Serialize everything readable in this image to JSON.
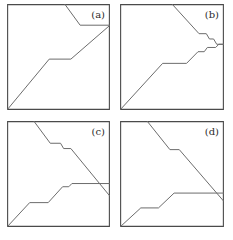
{
  "figure": {
    "width": 233,
    "height": 240,
    "background": "#ffffff",
    "frame_color": "#4a4a4a",
    "line_color": "#6b6b6b",
    "label_color": "#2a2a2a",
    "panel_count": 4,
    "layout": "2x2 grid"
  },
  "chart_data": {
    "type": "line",
    "title": "",
    "xlabel": "",
    "ylabel": "",
    "grid": false,
    "legend": "none",
    "axis_ranges": {
      "x": [
        0,
        100
      ],
      "y": [
        0,
        100
      ]
    },
    "panels": [
      {
        "id": "a",
        "label": "(a)",
        "frame": {
          "x": 7,
          "y": 4,
          "width": 103,
          "height": 106
        },
        "series": [
          {
            "name": "upper-path",
            "points": [
              [
                56,
                0
              ],
              [
                71,
                20
              ],
              [
                100,
                20
              ]
            ]
          },
          {
            "name": "lower-path",
            "points": [
              [
                0,
                100
              ],
              [
                41,
                52
              ],
              [
                62,
                52
              ],
              [
                100,
                20
              ]
            ]
          }
        ]
      },
      {
        "id": "b",
        "label": "(b)",
        "frame": {
          "x": 120,
          "y": 4,
          "width": 104,
          "height": 106
        },
        "series": [
          {
            "name": "upper-path",
            "points": [
              [
                50,
                0
              ],
              [
                76,
                28
              ],
              [
                83,
                28
              ],
              [
                86,
                33
              ],
              [
                90,
                33
              ],
              [
                93,
                38
              ],
              [
                100,
                38
              ]
            ]
          },
          {
            "name": "lower-path",
            "points": [
              [
                0,
                100
              ],
              [
                41,
                56
              ],
              [
                64,
                56
              ],
              [
                75,
                45
              ],
              [
                81,
                45
              ],
              [
                84,
                41
              ],
              [
                92,
                41
              ],
              [
                95,
                38
              ],
              [
                100,
                38
              ]
            ]
          }
        ]
      },
      {
        "id": "c",
        "label": "(c)",
        "frame": {
          "x": 7,
          "y": 121,
          "width": 103,
          "height": 106
        },
        "series": [
          {
            "name": "upper-path",
            "points": [
              [
                26,
                0
              ],
              [
                42,
                21
              ],
              [
                52,
                21
              ],
              [
                55,
                26
              ],
              [
                62,
                26
              ],
              [
                100,
                71
              ]
            ]
          },
          {
            "name": "lower-path",
            "points": [
              [
                0,
                100
              ],
              [
                22,
                77
              ],
              [
                40,
                77
              ],
              [
                54,
                62
              ],
              [
                60,
                62
              ],
              [
                63,
                59
              ],
              [
                100,
                59
              ]
            ]
          }
        ]
      },
      {
        "id": "d",
        "label": "(d)",
        "frame": {
          "x": 120,
          "y": 121,
          "width": 104,
          "height": 106
        },
        "series": [
          {
            "name": "upper-path",
            "points": [
              [
                26,
                0
              ],
              [
                48,
                27
              ],
              [
                57,
                27
              ],
              [
                100,
                76
              ]
            ]
          },
          {
            "name": "lower-path",
            "points": [
              [
                0,
                100
              ],
              [
                20,
                82
              ],
              [
                37,
                82
              ],
              [
                52,
                68
              ],
              [
                100,
                68
              ]
            ]
          }
        ]
      }
    ]
  },
  "labels": {
    "a": "(a)",
    "b": "(b)",
    "c": "(c)",
    "d": "(d)"
  }
}
